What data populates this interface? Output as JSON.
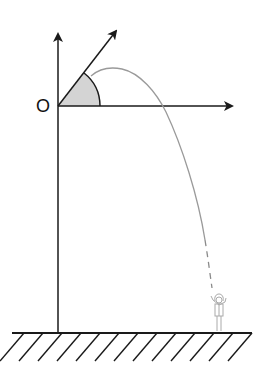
{
  "diagram": {
    "type": "projectile-motion",
    "origin_label": "O",
    "axes": {
      "vertical": {
        "direction": "up",
        "has_arrow": true
      },
      "horizontal": {
        "direction": "right",
        "has_arrow": true
      }
    },
    "launch_vector": {
      "direction": "up-right",
      "has_arrow": true
    },
    "launch_angle": {
      "shaded": true,
      "fill": "#d4d4d4"
    },
    "trajectory": {
      "shape": "parabola",
      "color": "#9a9a9a",
      "ends_dashed": true
    },
    "person": {
      "position": "ground, under trajectory end"
    },
    "ground": {
      "hatched": true,
      "hatch_count": 13
    },
    "colors": {
      "line": "#1a1a1a",
      "trajectory": "#9a9a9a",
      "shade": "#d4d4d4",
      "background": "#ffffff"
    }
  }
}
